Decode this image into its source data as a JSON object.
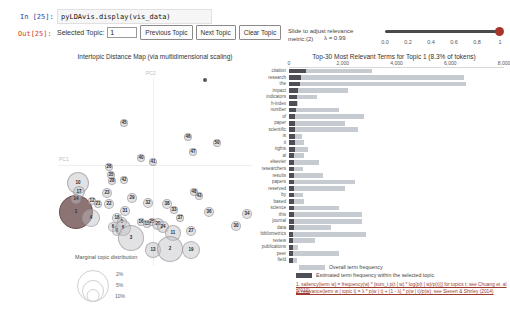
{
  "notebook": {
    "in_label": "In [25]:",
    "out_label": "Out[25]:",
    "code": "pyLDAvis.display(vis_data)"
  },
  "controls": {
    "selected_topic_label": "Selected Topic:",
    "topic_value": "1",
    "prev_button": "Previous Topic",
    "next_button": "Next Topic",
    "clear_button": "Clear Topic"
  },
  "slider": {
    "label_line1": "Slide to adjust relevance",
    "label_line2": "metric:(2)",
    "lambda_label": "λ = 0.99",
    "ticks": [
      "0.0",
      "0.2",
      "0.4",
      "0.6",
      "0.8",
      "1"
    ],
    "track_color": "#4a4a4a",
    "handle_color": "#a8352b"
  },
  "map": {
    "title": "Intertopic Distance Map (via multidimensional scaling)",
    "x_axis_label": "PC1",
    "y_axis_label": "PC2",
    "marginal_legend": {
      "title": "Marginal topic distribution",
      "sizes": [
        "2%",
        "5%",
        "10%"
      ]
    },
    "bubble_fill": "rgba(190,190,195,0.45)",
    "bubble_border": "rgba(140,140,145,0.55)",
    "selected_fill": "#8d7474",
    "selected_border": "#6b5252",
    "topics": [
      {
        "label": "1",
        "x": 76,
        "y": 212,
        "r": 17,
        "selected": true
      },
      {
        "label": "10",
        "x": 78,
        "y": 183,
        "r": 11
      },
      {
        "label": "17",
        "x": 79,
        "y": 192,
        "r": 6
      },
      {
        "label": "14",
        "x": 76,
        "y": 199,
        "r": 5
      },
      {
        "label": "12",
        "x": 92,
        "y": 201,
        "r": 4
      },
      {
        "label": "21",
        "x": 98,
        "y": 204,
        "r": 4
      },
      {
        "label": "4",
        "x": 91,
        "y": 218,
        "r": 9
      },
      {
        "label": "23",
        "x": 107,
        "y": 193,
        "r": 5
      },
      {
        "label": "22",
        "x": 109,
        "y": 204,
        "r": 5
      },
      {
        "label": "26",
        "x": 109,
        "y": 167,
        "r": 4
      },
      {
        "label": "35",
        "x": 111,
        "y": 175,
        "r": 4
      },
      {
        "label": "28",
        "x": 112,
        "y": 181,
        "r": 4
      },
      {
        "label": "42",
        "x": 124,
        "y": 180,
        "r": 4
      },
      {
        "label": "45",
        "x": 124,
        "y": 123,
        "r": 4
      },
      {
        "label": "40",
        "x": 141,
        "y": 158,
        "r": 4
      },
      {
        "label": "41",
        "x": 153,
        "y": 162,
        "r": 4
      },
      {
        "label": "46",
        "x": 188,
        "y": 137,
        "r": 4
      },
      {
        "label": "50",
        "x": 217,
        "y": 143,
        "r": 4
      },
      {
        "label": "47",
        "x": 193,
        "y": 152,
        "r": 4
      },
      {
        "label": "48",
        "x": 194,
        "y": 192,
        "r": 4
      },
      {
        "label": "43",
        "x": 199,
        "y": 196,
        "r": 4
      },
      {
        "label": "29",
        "x": 132,
        "y": 198,
        "r": 5
      },
      {
        "label": "31",
        "x": 125,
        "y": 211,
        "r": 5
      },
      {
        "label": "18",
        "x": 117,
        "y": 218,
        "r": 5
      },
      {
        "label": "5",
        "x": 122,
        "y": 222,
        "r": 5
      },
      {
        "label": "6",
        "x": 113,
        "y": 227,
        "r": 5
      },
      {
        "label": "8",
        "x": 117,
        "y": 231,
        "r": 5
      },
      {
        "label": "9",
        "x": 123,
        "y": 228,
        "r": 8
      },
      {
        "label": "3",
        "x": 131,
        "y": 238,
        "r": 13
      },
      {
        "label": "16",
        "x": 141,
        "y": 222,
        "r": 4
      },
      {
        "label": "15",
        "x": 147,
        "y": 224,
        "r": 4
      },
      {
        "label": "25",
        "x": 152,
        "y": 222,
        "r": 4
      },
      {
        "label": "20",
        "x": 158,
        "y": 224,
        "r": 6
      },
      {
        "label": "24",
        "x": 163,
        "y": 227,
        "r": 6
      },
      {
        "label": "32",
        "x": 148,
        "y": 203,
        "r": 5
      },
      {
        "label": "38",
        "x": 167,
        "y": 204,
        "r": 5
      },
      {
        "label": "33",
        "x": 174,
        "y": 210,
        "r": 4
      },
      {
        "label": "37",
        "x": 180,
        "y": 218,
        "r": 4
      },
      {
        "label": "11",
        "x": 173,
        "y": 233,
        "r": 8
      },
      {
        "label": "27",
        "x": 191,
        "y": 231,
        "r": 5
      },
      {
        "label": "36",
        "x": 209,
        "y": 212,
        "r": 5
      },
      {
        "label": "30",
        "x": 236,
        "y": 226,
        "r": 5
      },
      {
        "label": "34",
        "x": 247,
        "y": 214,
        "r": 5
      },
      {
        "label": "13",
        "x": 153,
        "y": 250,
        "r": 8
      },
      {
        "label": "2",
        "x": 170,
        "y": 249,
        "r": 13
      },
      {
        "label": "19",
        "x": 191,
        "y": 250,
        "r": 9
      },
      {
        "label": "",
        "x": 205,
        "y": 80,
        "r": 2,
        "dot": true
      }
    ]
  },
  "barchart": {
    "title": "Top-30 Most Relevant Terms for Topic 1 (8.3% of tokens)",
    "axis_ticks": [
      "0",
      "2,000",
      "4,000",
      "6,000",
      "8,000"
    ],
    "axis_max": 8000,
    "overall_color": "#c6cbd2",
    "topic_color": "#4e4e57",
    "legend": [
      {
        "kind": "overall",
        "label": "Overall term frequency",
        "swatch_w": 26
      },
      {
        "kind": "topic",
        "label": "Estimated term frequency within the selected topic",
        "swatch_w": 16
      }
    ],
    "footnotes": [
      "1. saliency(term w) = frequency(w) * [sum_t p(t | w) * log(p(t | w)/p(t))] for topics t; see Chuang et. al (2012)",
      "2. relevance(term w | topic t) = λ * p(w | t) + (1 - λ) * p(w | t)/p(w); see Sievert & Shirley (2014)"
    ],
    "terms": [
      {
        "term": "citation",
        "overall": 3100,
        "topic": 650
      },
      {
        "term": "research",
        "overall": 6500,
        "topic": 430
      },
      {
        "term": "the",
        "overall": 6600,
        "topic": 400
      },
      {
        "term": "impact",
        "overall": 2200,
        "topic": 340
      },
      {
        "term": "indicators",
        "overall": 1050,
        "topic": 300
      },
      {
        "term": "h-index",
        "overall": 320,
        "topic": 280
      },
      {
        "term": "number",
        "overall": 1850,
        "topic": 250
      },
      {
        "term": "of",
        "overall": 2800,
        "topic": 240
      },
      {
        "term": "paper",
        "overall": 2100,
        "topic": 230
      },
      {
        "term": "scientific",
        "overall": 2550,
        "topic": 225
      },
      {
        "term": "is",
        "overall": 500,
        "topic": 215
      },
      {
        "term": "it",
        "overall": 560,
        "topic": 210
      },
      {
        "term": "rights",
        "overall": 700,
        "topic": 205
      },
      {
        "term": "al",
        "overall": 540,
        "topic": 200
      },
      {
        "term": "elsevier",
        "overall": 1100,
        "topic": 195
      },
      {
        "term": "researchers",
        "overall": 530,
        "topic": 190
      },
      {
        "term": "results",
        "overall": 1280,
        "topic": 188
      },
      {
        "term": "papers",
        "overall": 2440,
        "topic": 185
      },
      {
        "term": "reserved",
        "overall": 2090,
        "topic": 182
      },
      {
        "term": "by",
        "overall": 530,
        "topic": 180
      },
      {
        "term": "based",
        "overall": 570,
        "topic": 178
      },
      {
        "term": "science",
        "overall": 1870,
        "topic": 175
      },
      {
        "term": "this",
        "overall": 2700,
        "topic": 172
      },
      {
        "term": "journal",
        "overall": 2700,
        "topic": 170
      },
      {
        "term": "data",
        "overall": 1560,
        "topic": 168
      },
      {
        "term": "bibliometrics",
        "overall": 2870,
        "topic": 165
      },
      {
        "term": "review",
        "overall": 950,
        "topic": 162
      },
      {
        "term": "publications",
        "overall": 330,
        "topic": 160
      },
      {
        "term": "peer",
        "overall": 1870,
        "topic": 158
      },
      {
        "term": "field",
        "overall": 300,
        "topic": 155
      }
    ]
  }
}
